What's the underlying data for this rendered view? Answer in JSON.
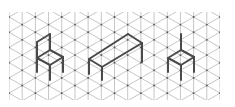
{
  "diagram": {
    "type": "isometric-grid-drawing",
    "grid": {
      "x_start": 9,
      "x_end": 220,
      "y_start": 12,
      "y_end": 100,
      "columns": 17,
      "col_spacing": 13.19,
      "line_color": "#b8b8b8",
      "node_color": "#555555"
    },
    "stroke_color": "#4a4a4a",
    "objects": [
      {
        "name": "chair-left",
        "label": "chair",
        "segments": [
          [
            [
              37,
              42
            ],
            [
              50,
              34
            ]
          ],
          [
            [
              37,
              42
            ],
            [
              37,
              58
            ]
          ],
          [
            [
              50,
              34
            ],
            [
              50,
              50
            ]
          ],
          [
            [
              37,
              58
            ],
            [
              50,
              50
            ]
          ],
          [
            [
              50,
              50
            ],
            [
              63,
              57
            ]
          ],
          [
            [
              37,
              58
            ],
            [
              50,
              65
            ]
          ],
          [
            [
              50,
              65
            ],
            [
              63,
              57
            ]
          ],
          [
            [
              37,
              58
            ],
            [
              37,
              72
            ]
          ],
          [
            [
              50,
              65
            ],
            [
              50,
              80
            ]
          ],
          [
            [
              63,
              57
            ],
            [
              63,
              72
            ]
          ]
        ]
      },
      {
        "name": "bench",
        "label": "bench",
        "segments": [
          [
            [
              89,
              59
            ],
            [
              128,
              34
            ]
          ],
          [
            [
              128,
              34
            ],
            [
              142,
              43
            ]
          ],
          [
            [
              89,
              59
            ],
            [
              102,
              67
            ]
          ],
          [
            [
              102,
              67
            ],
            [
              142,
              43
            ]
          ],
          [
            [
              89,
              59
            ],
            [
              89,
              74
            ]
          ],
          [
            [
              102,
              67
            ],
            [
              102,
              80
            ]
          ],
          [
            [
              142,
              43
            ],
            [
              142,
              62
            ]
          ]
        ]
      },
      {
        "name": "chair-right",
        "label": "chair",
        "segments": [
          [
            [
              181,
              34
            ],
            [
              181,
              50
            ]
          ],
          [
            [
              181,
              50
            ],
            [
              194,
              57
            ]
          ],
          [
            [
              168,
              58
            ],
            [
              181,
              50
            ]
          ],
          [
            [
              168,
              58
            ],
            [
              181,
              65
            ]
          ],
          [
            [
              181,
              65
            ],
            [
              194,
              57
            ]
          ],
          [
            [
              168,
              58
            ],
            [
              168,
              72
            ]
          ],
          [
            [
              181,
              65
            ],
            [
              181,
              80
            ]
          ],
          [
            [
              194,
              57
            ],
            [
              194,
              72
            ]
          ]
        ]
      }
    ]
  }
}
